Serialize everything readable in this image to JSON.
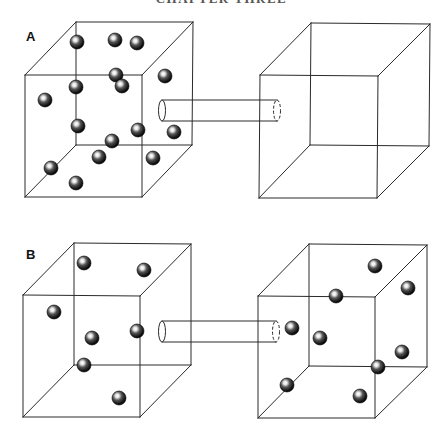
{
  "header": {
    "text": "CHAPTER THREE",
    "clipped": true
  },
  "colors": {
    "line": "#2a2a2a",
    "sphere_dark": "#111111",
    "sphere_highlight": "#ffffff",
    "background": "#ffffff"
  },
  "panels": [
    {
      "id": "A",
      "label": "A",
      "label_pos": [
        26,
        41
      ],
      "cubes": [
        {
          "name": "left-chamber",
          "front": [
            [
              25,
              75
            ],
            [
              142,
              75
            ],
            [
              142,
              197
            ],
            [
              25,
              197
            ]
          ],
          "back": [
            [
              76,
              22
            ],
            [
              193,
              22
            ],
            [
              192,
              145
            ],
            [
              76,
              145
            ]
          ],
          "spheres": [
            [
              77,
              42
            ],
            [
              115,
              40
            ],
            [
              137,
              43
            ],
            [
              116,
              75
            ],
            [
              122,
              86
            ],
            [
              165,
              76
            ],
            [
              76,
              87
            ],
            [
              45,
              100
            ],
            [
              78,
              126
            ],
            [
              138,
              130
            ],
            [
              174,
              132
            ],
            [
              112,
              141
            ],
            [
              99,
              157
            ],
            [
              153,
              158
            ],
            [
              51,
              168
            ],
            [
              76,
              183
            ]
          ]
        },
        {
          "name": "right-chamber",
          "front": [
            [
              260,
              75
            ],
            [
              378,
              76
            ],
            [
              377,
              198
            ],
            [
              259,
              198
            ]
          ],
          "back": [
            [
              311,
              23
            ],
            [
              430,
              24
            ],
            [
              429,
              146
            ],
            [
              310,
              145
            ]
          ],
          "spheres": []
        }
      ],
      "tube": {
        "x1": 162,
        "x2": 277,
        "y_top": 100,
        "y_bottom": 121
      }
    },
    {
      "id": "B",
      "label": "B",
      "label_pos": [
        26,
        259
      ],
      "cubes": [
        {
          "name": "left-chamber",
          "front": [
            [
              23,
              295
            ],
            [
              140,
              296
            ],
            [
              140,
              417
            ],
            [
              23,
              417
            ]
          ],
          "back": [
            [
              74,
              243
            ],
            [
              191,
              244
            ],
            [
              191,
              365
            ],
            [
              74,
              365
            ]
          ],
          "spheres": [
            [
              84,
              263
            ],
            [
              144,
              270
            ],
            [
              54,
              312
            ],
            [
              92,
              338
            ],
            [
              137,
              331
            ],
            [
              84,
              365
            ],
            [
              119,
              398
            ]
          ]
        },
        {
          "name": "right-chamber",
          "front": [
            [
              258,
              296
            ],
            [
              375,
              297
            ],
            [
              375,
              418
            ],
            [
              258,
              418
            ]
          ],
          "back": [
            [
              309,
              244
            ],
            [
              427,
              245
            ],
            [
              427,
              367
            ],
            [
              309,
              366
            ]
          ],
          "spheres": [
            [
              375,
              266
            ],
            [
              408,
              288
            ],
            [
              336,
              296
            ],
            [
              292,
              328
            ],
            [
              320,
              338
            ],
            [
              402,
              352
            ],
            [
              378,
              367
            ],
            [
              287,
              385
            ],
            [
              360,
              396
            ]
          ]
        }
      ],
      "tube": {
        "x1": 162,
        "x2": 276,
        "y_top": 321,
        "y_bottom": 342
      }
    }
  ],
  "sphere_radius": 7
}
